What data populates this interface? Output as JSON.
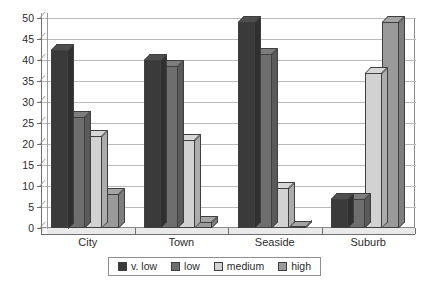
{
  "chart_data": {
    "type": "bar",
    "title": "",
    "xlabel": "",
    "ylabel": "",
    "categories": [
      "City",
      "Town",
      "Seaside",
      "Suburb"
    ],
    "series": [
      {
        "name": "v. low",
        "color": "#3a3a3a",
        "values": [
          42.5,
          40.0,
          49.0,
          7.0
        ]
      },
      {
        "name": "low",
        "color": "#6e6e6e",
        "values": [
          26.5,
          38.5,
          41.5,
          7.0
        ]
      },
      {
        "name": "medium",
        "color": "#d2d2d2",
        "values": [
          22.0,
          21.0,
          9.5,
          37.0
        ]
      },
      {
        "name": "high",
        "color": "#9a9a9a",
        "values": [
          8.0,
          1.5,
          0.2,
          49.0
        ]
      }
    ],
    "ylim": [
      0,
      50
    ],
    "ytick_step": 5,
    "yticks": [
      0,
      5,
      10,
      15,
      20,
      25,
      30,
      35,
      40,
      45,
      50
    ],
    "ytick_labels": [
      "0",
      "5",
      "10",
      "15",
      "20",
      "25",
      "30",
      "35",
      "40",
      "45",
      "50"
    ],
    "grid": true,
    "grid_axis": "y",
    "legend_position": "bottom",
    "style": "3d-column",
    "plot_background": "#ffffff",
    "grid_color": "#b9b9b9",
    "axis_color": "#6f6f6f"
  },
  "legend": {
    "items": [
      {
        "label": "v. low",
        "color": "#3a3a3a"
      },
      {
        "label": "low",
        "color": "#6e6e6e"
      },
      {
        "label": "medium",
        "color": "#d2d2d2"
      },
      {
        "label": "high",
        "color": "#9a9a9a"
      }
    ]
  }
}
